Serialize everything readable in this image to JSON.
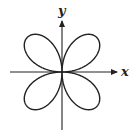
{
  "diagram": {
    "type": "polar-curve",
    "equation": "r = sin(2θ)",
    "petals": 4,
    "axes": {
      "x_label": "x",
      "y_label": "y"
    }
  }
}
